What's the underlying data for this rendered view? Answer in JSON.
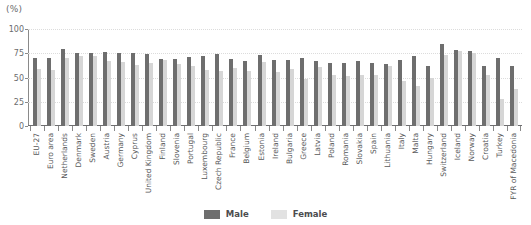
{
  "chart": {
    "unit_label": "(%)",
    "legend_position": "bottom-center"
  },
  "legend": {
    "male_label": "Male",
    "female_label": "Female"
  },
  "colors": {
    "male": "#6e6e6e",
    "female": "#d6d6d6",
    "axis": "#8a8a8a",
    "grid": "#dcdcdc",
    "text": "#58585a",
    "background": "#ffffff"
  },
  "chart_data": {
    "type": "bar",
    "title": "",
    "subtitle": "",
    "xlabel": "",
    "ylabel": "(%)",
    "ylim": [
      0,
      100
    ],
    "yticks": [
      0,
      25,
      50,
      75,
      100
    ],
    "ytick_labels": [
      "0",
      "25",
      "50",
      "75",
      "100"
    ],
    "grid": true,
    "legend": "bottom-center",
    "categories": [
      "EU-27",
      "Euro area",
      "Netherlands",
      "Denmark",
      "Sweden",
      "Austria",
      "Germany",
      "Cyprus",
      "United Kingdom",
      "Finland",
      "Slovenia",
      "Portugal",
      "Luxembourg",
      "Czech Republic",
      "France",
      "Belgium",
      "Estonia",
      "Ireland",
      "Bulgaria",
      "Greece",
      "Latvia",
      "Poland",
      "Romania",
      "Slovakia",
      "Spain",
      "Lithuania",
      "Italy",
      "Malta",
      "Hungary",
      "Switzerland",
      "Iceland",
      "Norway",
      "Croatia",
      "Turkey",
      "FYR of Macedonia"
    ],
    "series": [
      {
        "name": "Male",
        "color": "#6e6e6e",
        "values": [
          70,
          70,
          79,
          75,
          75,
          76,
          75,
          75,
          74,
          69,
          69,
          71,
          72,
          74,
          69,
          67,
          73,
          68,
          68,
          70,
          67,
          65,
          65,
          67,
          65,
          64,
          68,
          72,
          62,
          85,
          78,
          77,
          62,
          70,
          62
        ]
      },
      {
        "name": "Female",
        "color": "#d6d6d6",
        "values": [
          59,
          58,
          70,
          72,
          72,
          67,
          66,
          63,
          65,
          68,
          64,
          62,
          58,
          57,
          60,
          57,
          66,
          56,
          59,
          48,
          61,
          53,
          52,
          53,
          53,
          62,
          46,
          41,
          50,
          73,
          77,
          75,
          53,
          28,
          38
        ]
      }
    ]
  }
}
